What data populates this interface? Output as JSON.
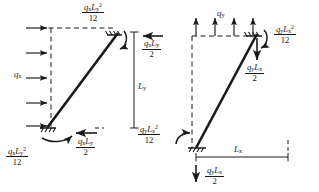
{
  "figure": {
    "type": "engineering-free-body-diagram",
    "ink_color": "#1a1a1a",
    "background_color": "#ffffff"
  },
  "left_diagram": {
    "name": "horizontal-load-case",
    "load_label": "q",
    "load_subscript": "x",
    "load_arrow_count": 5,
    "load_direction": "right",
    "dimension": {
      "label": "L",
      "subscript": "y",
      "orientation": "vertical"
    },
    "top_moment": {
      "numerator_base": "q",
      "numerator_sub1": "x",
      "numerator_var2": "L",
      "numerator_sub2": "y",
      "numerator_exp": "2",
      "denominator": "12"
    },
    "top_shear": {
      "numerator_base": "q",
      "numerator_sub1": "x",
      "numerator_var2": "L",
      "numerator_sub2": "y",
      "denominator": "2",
      "arrow_direction": "left"
    },
    "bottom_moment": {
      "numerator_base": "q",
      "numerator_sub1": "x",
      "numerator_var2": "L",
      "numerator_sub2": "y",
      "numerator_exp": "2",
      "denominator": "12"
    },
    "bottom_shear": {
      "numerator_base": "q",
      "numerator_sub1": "x",
      "numerator_var2": "L",
      "numerator_sub2": "y",
      "denominator": "2",
      "arrow_direction": "left"
    }
  },
  "right_diagram": {
    "name": "vertical-load-case",
    "load_label": "q",
    "load_subscript": "y",
    "load_arrow_count": 4,
    "load_direction": "up",
    "dimension": {
      "label": "L",
      "subscript": "x",
      "orientation": "horizontal"
    },
    "top_moment": {
      "numerator_base": "q",
      "numerator_sub1": "y",
      "numerator_var2": "L",
      "numerator_sub2": "x",
      "numerator_exp": "2",
      "denominator": "12"
    },
    "top_shear": {
      "numerator_base": "q",
      "numerator_sub1": "y",
      "numerator_var2": "L",
      "numerator_sub2": "x",
      "denominator": "2",
      "arrow_direction": "down"
    },
    "bottom_moment": {
      "numerator_base": "q",
      "numerator_sub1": "y",
      "numerator_var2": "L",
      "numerator_sub2": "x",
      "numerator_exp": "2",
      "denominator": "12"
    },
    "bottom_shear": {
      "numerator_base": "q",
      "numerator_sub1": "y",
      "numerator_var2": "L",
      "numerator_sub2": "x",
      "denominator": "2",
      "arrow_direction": "down"
    }
  }
}
